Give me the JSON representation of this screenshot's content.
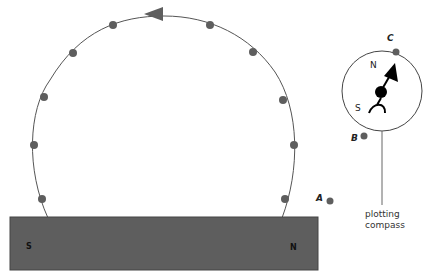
{
  "magnet": {
    "south_label": "S",
    "north_label": "N",
    "color": "#5e5e5e"
  },
  "field_line": {
    "dot_color": "#5e5e5e",
    "arrow_direction": "left"
  },
  "points": {
    "a": "A",
    "b": "B",
    "c": "C"
  },
  "compass": {
    "north_label": "N",
    "south_label": "S",
    "caption_line1": "plotting",
    "caption_line2": "compass"
  }
}
